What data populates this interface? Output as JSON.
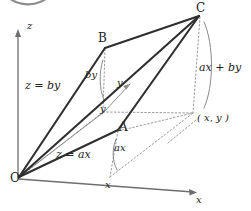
{
  "figure": {
    "background_color": "#ffffff",
    "ink_color": "#2b2b2b",
    "solid_line_color": "#3a3a3a",
    "thin_line_color": "#7a7a7a",
    "dotted_line_color": "#9a9a9a",
    "width": 251,
    "height": 211
  },
  "axes": {
    "z": {
      "label": "z",
      "x": 27,
      "y": 27
    },
    "y": {
      "label": "y",
      "x": 117,
      "y": 80
    },
    "x": {
      "label": "x",
      "x": 196,
      "y": 196
    }
  },
  "vertices": {
    "origin": {
      "label": "O",
      "x": 12,
      "y": 172
    },
    "a": {
      "label": "A",
      "x": 119,
      "y": 122
    },
    "b": {
      "label": "B",
      "x": 99,
      "y": 33
    },
    "c": {
      "label": "C",
      "x": 196,
      "y": 4
    }
  },
  "annotations": {
    "z_eq_by": {
      "label": "z = by",
      "x": 26,
      "y": 81
    },
    "z_eq_ax": {
      "label": "z = ax",
      "x": 56,
      "y": 149
    },
    "by": {
      "label": "by",
      "x": 85,
      "y": 71
    },
    "ax": {
      "label": "ax",
      "x": 113,
      "y": 144
    },
    "ax_plus_by": {
      "label": "ax + by",
      "x": 198,
      "y": 63
    },
    "point_xy": {
      "label": "( x, y )",
      "x": 197,
      "y": 114
    },
    "y_foot": {
      "label": "y",
      "x": 100,
      "y": 105
    },
    "x_foot": {
      "label": "x",
      "x": 105,
      "y": 180
    }
  },
  "geometry": {
    "origin_point": [
      18,
      178
    ],
    "a_point": [
      118,
      130
    ],
    "b_point": [
      105,
      47
    ],
    "c_point": [
      200,
      15
    ],
    "x_foot_point": [
      108,
      178
    ],
    "y_tip_point": [
      130,
      83
    ],
    "xy_point": [
      193,
      113
    ],
    "z_axis_top": [
      18,
      30
    ],
    "x_axis_tip": [
      196,
      192
    ]
  }
}
